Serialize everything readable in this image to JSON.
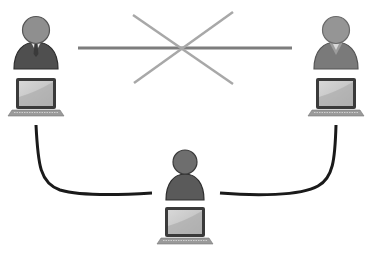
{
  "diagram": {
    "nodes": [
      {
        "id": "user-left",
        "role": "male user with tie",
        "device": "laptop",
        "position": "top-left"
      },
      {
        "id": "user-right",
        "role": "female user",
        "device": "laptop",
        "position": "top-right"
      },
      {
        "id": "user-center",
        "role": "user",
        "device": "laptop",
        "position": "bottom-center"
      }
    ],
    "edges": [
      {
        "from": "user-left",
        "to": "user-right",
        "style": "gray line",
        "blocked": true,
        "marker": "X"
      },
      {
        "from": "user-left",
        "to": "user-center",
        "style": "black curve",
        "blocked": false
      },
      {
        "from": "user-right",
        "to": "user-center",
        "style": "black curve",
        "blocked": false
      }
    ],
    "colors": {
      "person_body": "#555555",
      "person_head": "#8a8a8a",
      "female_body": "#7a7a7a",
      "laptop_frame": "#3a3a3a",
      "laptop_screen": "#c8c8c8",
      "laptop_base": "#9a9a9a",
      "link_line": "#7d7d7d",
      "cross_mark": "#a8a8a8",
      "connector": "#1a1a1a"
    }
  }
}
